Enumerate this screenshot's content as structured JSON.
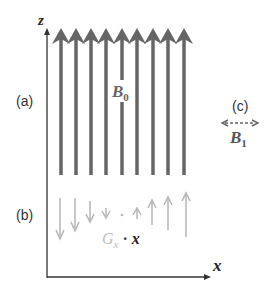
{
  "diagram": {
    "axes": {
      "z_label": "z",
      "x_label": "x"
    },
    "panel_labels": {
      "a": "(a)",
      "b": "(b)",
      "c": "(c)"
    },
    "main_field": {
      "symbol": "B",
      "subscript": "0",
      "arrow_count": 9,
      "color": "#666666"
    },
    "gradient": {
      "symbol": "G",
      "subscript": "x",
      "dot": "·",
      "variable": "x",
      "color": "#b0b0b0",
      "arrow_values": [
        -4,
        -3,
        -2,
        -1,
        0,
        1,
        2,
        3,
        4
      ]
    },
    "rf_field": {
      "symbol": "B",
      "subscript": "1",
      "style": "dashed double-headed arrow",
      "color": "#666666"
    }
  }
}
